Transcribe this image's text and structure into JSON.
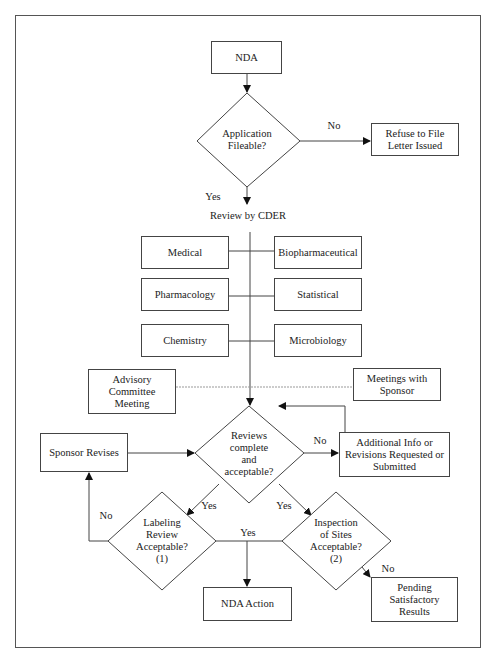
{
  "diagram": {
    "type": "flowchart",
    "nodes": {
      "nda": {
        "label": "NDA",
        "shape": "rectangle"
      },
      "fileable": {
        "label": "Application\nFileable?",
        "shape": "diamond"
      },
      "refuse": {
        "label": "Refuse to File\nLetter Issued",
        "shape": "rectangle"
      },
      "review_cder": {
        "label": "Review by CDER",
        "shape": "text"
      },
      "medical": {
        "label": "Medical",
        "shape": "rectangle"
      },
      "biopharm": {
        "label": "Biopharmaceutical",
        "shape": "rectangle"
      },
      "pharmacology": {
        "label": "Pharmacology",
        "shape": "rectangle"
      },
      "statistical": {
        "label": "Statistical",
        "shape": "rectangle"
      },
      "chemistry": {
        "label": "Chemistry",
        "shape": "rectangle"
      },
      "microbiology": {
        "label": "Microbiology",
        "shape": "rectangle"
      },
      "advisory": {
        "label": "Advisory\nCommittee\nMeeting",
        "shape": "rectangle"
      },
      "meetings_sponsor": {
        "label": "Meetings with\nSponsor",
        "shape": "rectangle"
      },
      "reviews_complete": {
        "label": "Reviews\ncomplete\nand\nacceptable?",
        "shape": "diamond"
      },
      "sponsor_revises": {
        "label": "Sponsor Revises",
        "shape": "rectangle"
      },
      "additional_info": {
        "label": "Additional Info or\nRevisions Requested or\nSubmitted",
        "shape": "rectangle"
      },
      "labeling": {
        "label": "Labeling\nReview\nAcceptable?\n(1)",
        "shape": "diamond"
      },
      "inspection": {
        "label": "Inspection\nof Sites\nAcceptable?\n(2)",
        "shape": "diamond"
      },
      "nda_action": {
        "label": "NDA Action",
        "shape": "rectangle"
      },
      "pending": {
        "label": "Pending\nSatisfactory\nResults",
        "shape": "rectangle"
      }
    },
    "edge_labels": {
      "fileable_no": "No",
      "fileable_yes": "Yes",
      "reviews_no": "No",
      "reviews_yes_left": "Yes",
      "reviews_yes_right": "Yes",
      "labeling_no": "No",
      "labeling_inspection_yes": "Yes",
      "inspection_no": "No"
    },
    "colors": {
      "stroke": "#444444",
      "background": "#ffffff",
      "text": "#222222",
      "dotted": "#999999"
    }
  }
}
